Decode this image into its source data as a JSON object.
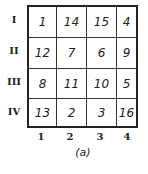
{
  "figure": {
    "caption": "(a)",
    "row_labels": [
      "I",
      "II",
      "III",
      "IV"
    ],
    "col_labels": [
      "1",
      "2",
      "3",
      "4"
    ],
    "cells": [
      [
        "1",
        "14",
        "15",
        "4"
      ],
      [
        "12",
        "7",
        "6",
        "9"
      ],
      [
        "8",
        "11",
        "10",
        "5"
      ],
      [
        "13",
        "2",
        "3",
        "16"
      ]
    ]
  }
}
